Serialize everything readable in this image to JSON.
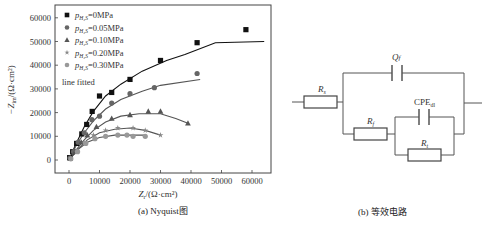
{
  "chart_data": {
    "type": "scatter",
    "title": "",
    "xlabel": "Z_r/(Ω·cm²)",
    "ylabel": "−Z_im/(Ω·cm²)",
    "xlim": [
      -5000,
      66000
    ],
    "ylim": [
      -5000,
      65000
    ],
    "xticks": [
      0,
      10000,
      20000,
      30000,
      40000,
      50000,
      60000
    ],
    "yticks": [
      0,
      10000,
      20000,
      30000,
      40000,
      50000,
      60000
    ],
    "grid": false,
    "legend_position": "upper left",
    "legend_note": "line  fitted",
    "series": [
      {
        "name": "p_H2S=0MPa",
        "marker": "square",
        "color": "#111111",
        "points": [
          [
            200,
            1000
          ],
          [
            1200,
            3500
          ],
          [
            2500,
            7000
          ],
          [
            4200,
            11000
          ],
          [
            5800,
            15000
          ],
          [
            7600,
            20500
          ],
          [
            10000,
            27000
          ],
          [
            14000,
            28500
          ],
          [
            20000,
            34000
          ],
          [
            30000,
            42000
          ],
          [
            42000,
            49500
          ],
          [
            58000,
            55000
          ]
        ],
        "fit": [
          [
            0,
            0
          ],
          [
            2000,
            6000
          ],
          [
            5000,
            14000
          ],
          [
            8000,
            20500
          ],
          [
            12000,
            27000
          ],
          [
            17000,
            32000
          ],
          [
            24000,
            37500
          ],
          [
            32000,
            42000
          ],
          [
            38000,
            44500
          ],
          [
            48000,
            49500
          ],
          [
            64000,
            50000
          ]
        ]
      },
      {
        "name": "p_H2S=0.05MPa",
        "marker": "circle",
        "color": "#666666",
        "points": [
          [
            300,
            800
          ],
          [
            1500,
            3500
          ],
          [
            3000,
            7500
          ],
          [
            5000,
            11500
          ],
          [
            7500,
            17000
          ],
          [
            10000,
            18500
          ],
          [
            14000,
            24000
          ],
          [
            20000,
            28000
          ],
          [
            28000,
            30500
          ],
          [
            42000,
            36500
          ]
        ],
        "fit": [
          [
            0,
            0
          ],
          [
            2500,
            6500
          ],
          [
            5000,
            11500
          ],
          [
            8000,
            16500
          ],
          [
            12000,
            21500
          ],
          [
            17000,
            25500
          ],
          [
            24000,
            29000
          ],
          [
            30000,
            31500
          ],
          [
            43000,
            34000
          ]
        ]
      },
      {
        "name": "p_H2S=0.10MPa",
        "marker": "triangle",
        "color": "#555555",
        "points": [
          [
            400,
            700
          ],
          [
            2000,
            3500
          ],
          [
            4000,
            7500
          ],
          [
            6000,
            10500
          ],
          [
            9000,
            14000
          ],
          [
            14000,
            17500
          ],
          [
            20000,
            19000
          ],
          [
            26000,
            20500
          ],
          [
            30000,
            20500
          ],
          [
            39000,
            15500
          ]
        ],
        "fit": [
          [
            0,
            0
          ],
          [
            2500,
            4500
          ],
          [
            5000,
            8500
          ],
          [
            8000,
            12500
          ],
          [
            12000,
            16000
          ],
          [
            17000,
            18500
          ],
          [
            23000,
            19500
          ],
          [
            30000,
            19500
          ],
          [
            35000,
            17500
          ],
          [
            39000,
            15500
          ]
        ]
      },
      {
        "name": "p_H2S=0.20MPa",
        "marker": "star",
        "color": "#888888",
        "points": [
          [
            500,
            600
          ],
          [
            2500,
            3500
          ],
          [
            5000,
            7000
          ],
          [
            8000,
            10500
          ],
          [
            12000,
            12500
          ],
          [
            16000,
            13500
          ],
          [
            21000,
            13500
          ],
          [
            25000,
            12500
          ],
          [
            30000,
            10500
          ]
        ],
        "fit": [
          [
            0,
            0
          ],
          [
            3000,
            4500
          ],
          [
            6000,
            8500
          ],
          [
            10000,
            11500
          ],
          [
            15000,
            13000
          ],
          [
            20000,
            13500
          ],
          [
            25000,
            12500
          ],
          [
            30000,
            10500
          ]
        ]
      },
      {
        "name": "p_H2S=0.30MPa",
        "marker": "circle-light",
        "color": "#999999",
        "points": [
          [
            600,
            500
          ],
          [
            2800,
            3500
          ],
          [
            5500,
            7000
          ],
          [
            8500,
            9000
          ],
          [
            12000,
            10000
          ],
          [
            16000,
            10500
          ],
          [
            19000,
            10500
          ],
          [
            21000,
            10000
          ],
          [
            25000,
            10000
          ]
        ],
        "fit": [
          [
            0,
            0
          ],
          [
            3000,
            4500
          ],
          [
            6000,
            7500
          ],
          [
            10000,
            9500
          ],
          [
            15000,
            10500
          ],
          [
            20000,
            10500
          ],
          [
            25000,
            10500
          ]
        ]
      }
    ]
  },
  "captions": {
    "left": "(a) Nyquist图",
    "right": "(b) 等效电路",
    "xlabel_main": "Z",
    "xlabel_sub": "r",
    "xlabel_rest": "/(Ω·cm²)",
    "ylabel": "−Z",
    "ylabel_sub": "im",
    "ylabel_rest": "/(Ω·cm²)"
  },
  "legend": {
    "prefix": "p",
    "prefix_sub": "H₂S",
    "items": [
      "=0MPa",
      "=0.05MPa",
      "=0.10MPa",
      "=0.20MPa",
      "=0.30MPa"
    ],
    "note": "line  fitted"
  },
  "circuit": {
    "labels": {
      "Rs_main": "R",
      "Rs_sub": "s",
      "Qf_main": "Q",
      "Qf_sub": "f",
      "Rf_main": "R",
      "Rf_sub": "f",
      "CPE_main": "CPE",
      "CPE_sub": "dl",
      "Rt_main": "R",
      "Rt_sub": "t"
    }
  }
}
